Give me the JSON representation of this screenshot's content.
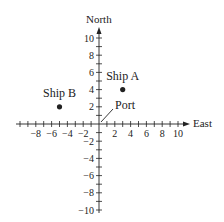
{
  "diagram": {
    "type": "coordinate-plane",
    "axes": {
      "x_label": "East",
      "y_label": "North",
      "x_range": [
        -10,
        10
      ],
      "y_range": [
        -10,
        10
      ],
      "minor_tick_step": 1,
      "x_tick_labels": [
        {
          "value": -8,
          "text": "−8"
        },
        {
          "value": -6,
          "text": "−6"
        },
        {
          "value": -4,
          "text": "−4"
        },
        {
          "value": -2,
          "text": "−2"
        },
        {
          "value": 2,
          "text": "2"
        },
        {
          "value": 4,
          "text": "4"
        },
        {
          "value": 6,
          "text": "6"
        },
        {
          "value": 8,
          "text": "8"
        },
        {
          "value": 10,
          "text": "10"
        }
      ],
      "y_tick_labels": [
        {
          "value": 10,
          "text": "10"
        },
        {
          "value": 8,
          "text": "8"
        },
        {
          "value": 6,
          "text": "6"
        },
        {
          "value": 4,
          "text": "4"
        },
        {
          "value": 2,
          "text": "2"
        },
        {
          "value": -2,
          "text": "−2"
        },
        {
          "value": -4,
          "text": "−4"
        },
        {
          "value": -6,
          "text": "−6"
        },
        {
          "value": -8,
          "text": "−8"
        },
        {
          "value": -10,
          "text": "−10"
        }
      ]
    },
    "points": [
      {
        "label": "Ship A",
        "x": 3,
        "y": 4
      },
      {
        "label": "Ship B",
        "x": -5,
        "y": 2
      }
    ],
    "annotations": [
      {
        "label": "Port",
        "points_to": [
          0,
          0
        ]
      }
    ],
    "colors": {
      "ink": "#222222",
      "background": "#ffffff"
    }
  }
}
